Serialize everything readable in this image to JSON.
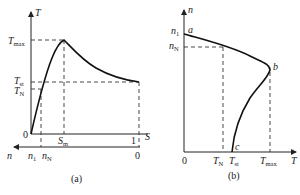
{
  "panel_a": {
    "caption": "(a)",
    "y_axis_label": "T",
    "x_axis_label_bottom": "n",
    "x_axis_label_right": "S",
    "origin_label": "0",
    "y_ticks": {
      "tmax": {
        "main": "T",
        "sub": "max"
      },
      "tst": {
        "main": "T",
        "sub": "st"
      },
      "tn": {
        "main": "T",
        "sub": "N"
      }
    },
    "s_ticks": {
      "sm": {
        "main": "S",
        "sub": "m"
      },
      "one": "1"
    },
    "n_ticks": {
      "n1": {
        "main": "n",
        "sub": "1"
      },
      "nn": {
        "main": "n",
        "sub": "N"
      },
      "zero": "0"
    }
  },
  "panel_b": {
    "caption": "(b)",
    "y_axis_label": "n",
    "x_axis_label": "T",
    "origin_label": "0",
    "y_ticks": {
      "n1": {
        "main": "n",
        "sub": "1"
      },
      "nn": {
        "main": "n",
        "sub": "N"
      }
    },
    "x_ticks": {
      "tn": {
        "main": "T",
        "sub": "N"
      },
      "tst": {
        "main": "T",
        "sub": "st"
      },
      "tmax": {
        "main": "T",
        "sub": "max"
      }
    },
    "points": {
      "a": "a",
      "b": "b",
      "c": "c"
    }
  }
}
